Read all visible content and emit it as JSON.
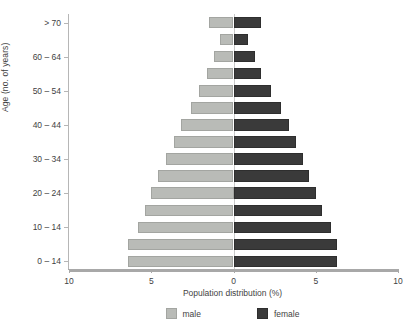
{
  "chart_data": {
    "type": "bar",
    "subtype": "population-pyramid",
    "title": "",
    "xlabel": "Population distribution (%)",
    "ylabel": "Age (no. of years)",
    "xlim": [
      -10,
      10
    ],
    "x_ticks": [
      {
        "value": -10,
        "label": "10"
      },
      {
        "value": -5,
        "label": "5"
      },
      {
        "value": 0,
        "label": "0"
      },
      {
        "value": 5,
        "label": "5"
      },
      {
        "value": 10,
        "label": "10"
      }
    ],
    "grid": false,
    "legend_position": "bottom",
    "legend": [
      {
        "name": "male",
        "color": "#b9bbb7"
      },
      {
        "name": "female",
        "color": "#3a3a3a"
      }
    ],
    "y_tick_labels": [
      "> 70",
      "60 – 64",
      "50 – 54",
      "40 – 44",
      "30 – 34",
      "20 – 24",
      "10 – 14",
      "0 – 14"
    ],
    "categories": [
      "> 70",
      "65 – 69",
      "60 – 64",
      "55 – 59",
      "50 – 54",
      "45 – 49",
      "40 – 44",
      "35 – 39",
      "30 – 34",
      "25 – 29",
      "20 – 24",
      "15 – 19",
      "10 – 14",
      "5 – 9",
      "0 – 14"
    ],
    "series": [
      {
        "name": "male",
        "color": "#b9bbb7",
        "values": [
          1.5,
          0.8,
          1.2,
          1.6,
          2.1,
          2.6,
          3.2,
          3.6,
          4.1,
          4.6,
          5.0,
          5.4,
          5.8,
          6.4,
          6.4
        ]
      },
      {
        "name": "female",
        "color": "#3a3a3a",
        "values": [
          1.7,
          0.9,
          1.3,
          1.7,
          2.3,
          2.9,
          3.4,
          3.8,
          4.2,
          4.6,
          5.0,
          5.4,
          5.9,
          6.3,
          6.3
        ]
      }
    ]
  }
}
